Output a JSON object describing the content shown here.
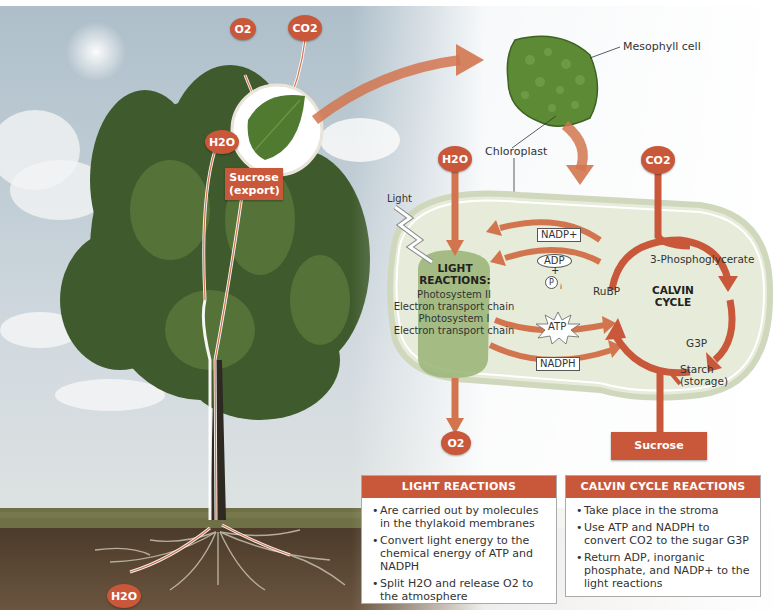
{
  "diagram": {
    "tree_labels": {
      "o2": "O2",
      "co2": "CO2",
      "h2o_leaf": "H2O",
      "h2o_root": "H2O",
      "sucrose_export": "Sucrose (export)"
    },
    "cell_labels": {
      "mesophyll": "Mesophyll cell",
      "chloroplast": "Chloroplast"
    },
    "chloroplast": {
      "h2o_in": "H2O",
      "co2_in": "CO2",
      "o2_out": "O2",
      "light": "Light",
      "light_reactions_title_1": "LIGHT",
      "light_reactions_title_2": "REACTIONS:",
      "light_reactions_steps": [
        "Photosystem II",
        "Electron transport chain",
        "Photosystem I",
        "Electron transport chain"
      ],
      "nadp_plus": "NADP+",
      "adp": "ADP",
      "plus": "+",
      "pi": "P",
      "pi_sub": "i",
      "atp": "ATP",
      "nadph": "NADPH",
      "calvin_title_1": "CALVIN",
      "calvin_title_2": "CYCLE",
      "phosphoglycerate": "3-Phosphoglycerate",
      "rubp": "RuBP",
      "g3p": "G3P",
      "starch_1": "Starch",
      "starch_2": "(storage)",
      "sucrose_export": "Sucrose (export)"
    },
    "panels": [
      {
        "title": "LIGHT REACTIONS",
        "bullets": [
          "Are carried out by molecules in the thylakoid membranes",
          "Convert light energy to the chemical energy of ATP and NADPH",
          "Split H2O and release O2 to the atmosphere"
        ]
      },
      {
        "title": "CALVIN CYCLE REACTIONS",
        "bullets": [
          "Take place in the stroma",
          "Use ATP and NADPH to convert CO2 to the sugar G3P",
          "Return ADP, inorganic phosphate, and NADP+ to the light reactions"
        ]
      }
    ],
    "colors": {
      "accent": "#c9583a",
      "arrow": "#d2754f",
      "chloroplast_fill": "#e6ecd9",
      "light_reaction_blob": "#9cb77a",
      "sky_top": "#b9c7d0",
      "soil": "#5a4632"
    }
  }
}
